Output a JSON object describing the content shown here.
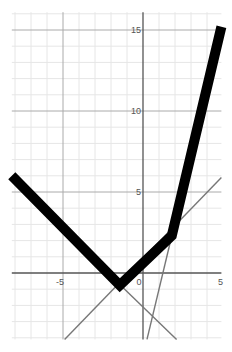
{
  "chart_data": {
    "type": "line",
    "title": "",
    "xlabel": "",
    "ylabel": "",
    "xlim": [
      -8.2,
      4.9
    ],
    "ylim": [
      -4.1,
      16.1
    ],
    "grid": true,
    "grid_minor_step": 1,
    "grid_major_step": 5,
    "x_tick_labels": [
      {
        "value": -5,
        "label": "-5"
      },
      {
        "value": 0,
        "label": "0"
      },
      {
        "value": 5,
        "label": "5"
      }
    ],
    "y_tick_labels": [
      {
        "value": 5,
        "label": "5"
      },
      {
        "value": 10,
        "label": "10"
      },
      {
        "value": 15,
        "label": "15"
      }
    ],
    "series": [
      {
        "name": "thick-piecewise",
        "style": "thick",
        "color": "#000000",
        "x": [
          -8.2,
          -1.45,
          1.8,
          4.9
        ],
        "y": [
          6.0,
          -0.75,
          2.3,
          15.2
        ]
      },
      {
        "name": "thin-line-slope-pos",
        "style": "thin",
        "color": "#777777",
        "x": [
          -4.9,
          4.9
        ],
        "y": [
          -4.1,
          5.9
        ]
      },
      {
        "name": "thin-line-slope-neg",
        "style": "thin",
        "color": "#777777",
        "x": [
          -2.1,
          2.1
        ],
        "y": [
          -0.1,
          -4.1
        ]
      },
      {
        "name": "thin-line-steep",
        "style": "thin",
        "color": "#777777",
        "x": [
          0.25,
          1.8
        ],
        "y": [
          -4.1,
          2.3
        ]
      }
    ]
  },
  "colors": {
    "background": "#ffffff",
    "minor_grid": "#e6e6e6",
    "major_grid": "#aaaaaa",
    "axis": "#555555",
    "thick_line": "#000000",
    "thin_line": "#777777"
  }
}
